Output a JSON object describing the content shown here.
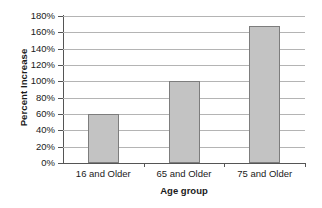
{
  "chart_data": {
    "type": "bar",
    "title": "",
    "subtitle": "",
    "categories": [
      "16 and Older",
      "65 and Older",
      "75 and Older"
    ],
    "values": [
      60,
      100,
      168
    ],
    "value_unit": "%",
    "xlabel": "Age group",
    "ylabel": "Percent Increase",
    "ylim": [
      0,
      180
    ],
    "ytick_step": 20,
    "yticks": [
      "0%",
      "20%",
      "40%",
      "60%",
      "80%",
      "100%",
      "120%",
      "140%",
      "160%",
      "180%"
    ],
    "ytick_values": [
      0,
      20,
      40,
      60,
      80,
      100,
      120,
      140,
      160,
      180
    ],
    "grid": true,
    "grid_axis": "y",
    "legend": false,
    "legend_position": "none",
    "bar_color": "#c3c3c3",
    "bar_border_color": "#7d7d7d",
    "gridline_color": "#b4b4b4",
    "axis_color": "#555555",
    "background": "#ffffff"
  }
}
